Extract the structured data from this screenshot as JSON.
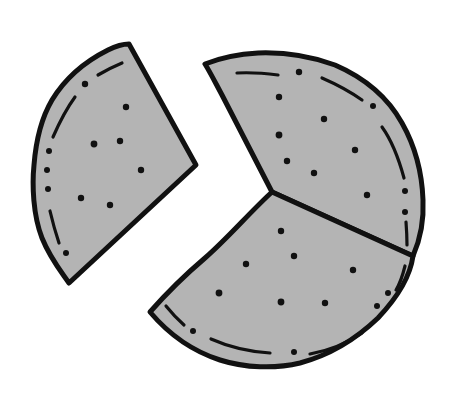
{
  "illustration": {
    "subject": "Pie with one slice removed",
    "fill_color": "#b4b4b4",
    "outline_color": "#111111",
    "background": "#ffffff",
    "pieces": [
      {
        "name": "detached-slice",
        "position": "left",
        "dots": 9
      },
      {
        "name": "upper-right-slice",
        "position": "upper-right",
        "dots": 11
      },
      {
        "name": "lower-slice",
        "position": "bottom",
        "dots": 10
      }
    ]
  }
}
